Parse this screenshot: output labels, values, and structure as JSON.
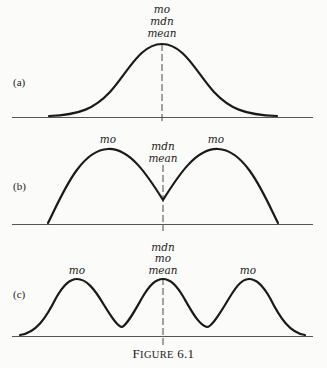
{
  "figure": {
    "caption_first": "F",
    "caption_rest": "IGURE",
    "caption_num": "6.1"
  },
  "panels": [
    {
      "id": "a",
      "label": "(a)",
      "shape": "unimodal symmetric (normal-like)",
      "center_labels": [
        "mo",
        "mdn",
        "mean"
      ],
      "peak_labels": []
    },
    {
      "id": "b",
      "label": "(b)",
      "shape": "bimodal symmetric",
      "center_labels": [
        "mdn",
        "mean"
      ],
      "peak_labels": [
        "mo",
        "mo"
      ]
    },
    {
      "id": "c",
      "label": "(c)",
      "shape": "trimodal symmetric",
      "center_labels": [
        "mdn",
        "mo",
        "mean"
      ],
      "peak_labels": [
        "mo",
        "mo"
      ]
    }
  ]
}
